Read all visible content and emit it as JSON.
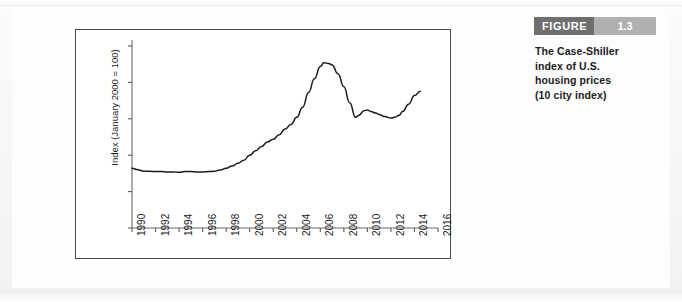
{
  "figure": {
    "label": "FIGURE",
    "number": "1.3",
    "caption_lines": [
      "The Case-Shiller",
      "index of U.S.",
      "housing prices",
      "(10 city index)"
    ],
    "header_dark_color": "#6f6f6f",
    "header_light_color": "#b0b0b0",
    "line_color": "#1a1a1a",
    "frame_color": "#4a4a4a"
  },
  "chart_data": {
    "type": "line",
    "title": "",
    "xlabel": "",
    "ylabel": "Index (January 2000 = 100)",
    "xlim": [
      1990,
      2016
    ],
    "ylim": [
      0,
      250
    ],
    "grid": false,
    "legend": null,
    "xticks": [
      "1990",
      "1992",
      "1994",
      "1996",
      "1998",
      "2000",
      "2002",
      "2004",
      "2006",
      "2008",
      "2010",
      "2012",
      "2014",
      "2016"
    ],
    "xtick_values": [
      1990,
      1992,
      1994,
      1996,
      1998,
      2000,
      2002,
      2004,
      2006,
      2008,
      2010,
      2012,
      2014,
      2016
    ],
    "yticks": [
      "0",
      "50",
      "100",
      "150",
      "200",
      "250"
    ],
    "ytick_values": [
      0,
      50,
      100,
      150,
      200,
      250
    ],
    "series": [
      {
        "name": "Case-Shiller 10 city index",
        "x": [
          1990.0,
          1990.5,
          1991.0,
          1991.5,
          1992.0,
          1992.5,
          1993.0,
          1993.5,
          1994.0,
          1994.5,
          1995.0,
          1995.5,
          1996.0,
          1996.5,
          1997.0,
          1997.5,
          1998.0,
          1998.5,
          1999.0,
          1999.5,
          2000.0,
          2000.5,
          2001.0,
          2001.5,
          2002.0,
          2002.5,
          2003.0,
          2003.5,
          2004.0,
          2004.5,
          2005.0,
          2005.5,
          2006.0,
          2006.3,
          2006.7,
          2007.0,
          2007.5,
          2008.0,
          2008.5,
          2009.0,
          2009.3,
          2009.7,
          2010.0,
          2010.3,
          2010.7,
          2011.0,
          2011.5,
          2012.0,
          2012.3,
          2012.7,
          2013.0,
          2013.5,
          2014.0,
          2014.5
        ],
        "y": [
          82,
          80,
          78,
          78,
          77.5,
          77.5,
          77,
          77,
          76.5,
          77.5,
          77.5,
          77,
          77,
          77.5,
          78,
          79.5,
          82,
          85,
          89,
          93,
          100,
          106,
          112,
          118,
          122,
          128,
          136,
          142,
          152,
          166,
          186,
          205,
          222,
          227,
          226,
          224,
          212,
          194,
          172,
          152,
          155,
          161,
          162,
          160,
          158,
          156,
          153,
          151,
          152,
          155,
          160,
          170,
          182,
          188
        ]
      }
    ]
  }
}
